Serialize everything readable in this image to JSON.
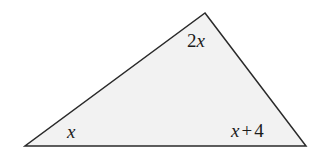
{
  "figure": {
    "type": "triangle-angle-diagram",
    "background_color": "#ffffff",
    "fill_color": "#f2f2f2",
    "stroke_color": "#2a2a2a",
    "stroke_width": 1.5,
    "vertices": {
      "apex": {
        "x": 205,
        "y": 13
      },
      "bottom_left": {
        "x": 25,
        "y": 146
      },
      "bottom_right": {
        "x": 306,
        "y": 146
      }
    },
    "labels": {
      "apex": {
        "text": "2x",
        "coefficient": "2",
        "variable": "x"
      },
      "bottom_left": {
        "text": "x",
        "variable": "x"
      },
      "bottom_right": {
        "text": "x + 4",
        "variable": "x",
        "operator": "+",
        "constant": "4"
      }
    }
  }
}
